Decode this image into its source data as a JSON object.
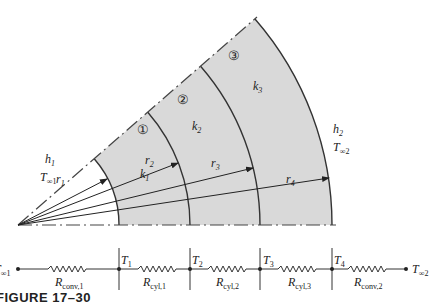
{
  "figure": {
    "caption": "FIGURE 17–30",
    "colors": {
      "fill": "#d9d9d9",
      "stroke": "#333333",
      "text": "#222222",
      "background": "#ffffff"
    },
    "geometry": {
      "origin": [
        18,
        225
      ],
      "wedge_angle_deg": 41,
      "radii_px": [
        101,
        172,
        242,
        314
      ]
    },
    "layers": [
      {
        "id": "1",
        "marker": "①",
        "k": "k",
        "k_sub": "1"
      },
      {
        "id": "2",
        "marker": "②",
        "k": "k",
        "k_sub": "2"
      },
      {
        "id": "3",
        "marker": "③",
        "k": "k",
        "k_sub": "3"
      }
    ],
    "radii_labels": [
      {
        "name": "r",
        "sub": "1"
      },
      {
        "name": "r",
        "sub": "2"
      },
      {
        "name": "r",
        "sub": "3"
      },
      {
        "name": "r",
        "sub": "4"
      }
    ],
    "inner_fluid": {
      "h": "h",
      "h_sub": "1",
      "T": "T",
      "T_sub": "∞1"
    },
    "outer_fluid": {
      "h": "h",
      "h_sub": "2",
      "T": "T",
      "T_sub": "∞2"
    }
  },
  "circuit": {
    "start_node": {
      "T": "T",
      "sub": "∞1"
    },
    "end_node": {
      "T": "T",
      "sub": "∞2"
    },
    "nodes": [
      {
        "T": "T",
        "sub": "1"
      },
      {
        "T": "T",
        "sub": "2"
      },
      {
        "T": "T",
        "sub": "3"
      },
      {
        "T": "T",
        "sub": "4"
      }
    ],
    "resistors": [
      {
        "R": "R",
        "sub": "conv,1"
      },
      {
        "R": "R",
        "sub": "cyl,1"
      },
      {
        "R": "R",
        "sub": "cyl,2"
      },
      {
        "R": "R",
        "sub": "cyl,3"
      },
      {
        "R": "R",
        "sub": "conv,2"
      }
    ]
  }
}
